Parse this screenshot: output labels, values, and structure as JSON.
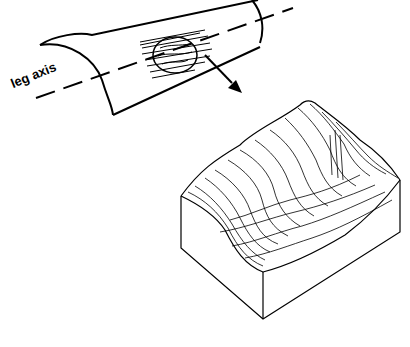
{
  "diagram": {
    "labels": {
      "axis": "leg axis"
    },
    "parts": [
      {
        "name": "leg-cylinder",
        "description": "half-cylinder representing the leg surface"
      },
      {
        "name": "sample-patch",
        "description": "contoured skin patch on cylinder"
      },
      {
        "name": "arrow",
        "description": "arrow pointing to magnified surface"
      },
      {
        "name": "surface-block",
        "description": "3D topography block of skin surface"
      }
    ],
    "colors": {
      "line": "#000000",
      "background": "#ffffff"
    }
  }
}
